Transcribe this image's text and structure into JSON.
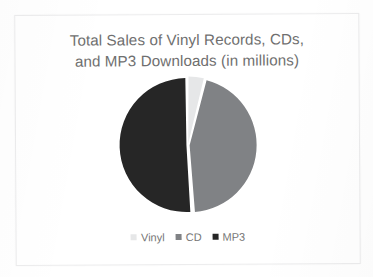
{
  "slide": {
    "title_line_1": "Total Sales of Vinyl Records, CDs,",
    "title_line_2": "and MP3 Downloads (in millions)"
  },
  "legend": {
    "entries": [
      {
        "label": "Vinyl",
        "color": "#E6E7E8",
        "marker": "square-marker-vinyl"
      },
      {
        "label": "CD",
        "color": "#808285",
        "marker": "square-marker-cd"
      },
      {
        "label": "MP3",
        "color": "#262626",
        "marker": "square-marker-mp3"
      }
    ]
  },
  "chart_data": {
    "type": "pie",
    "title": "Total Sales of Vinyl Records, CDs, and MP3 Downloads (in millions)",
    "xlabel": "",
    "ylabel": "",
    "categories": [
      "Vinyl",
      "CD",
      "MP3"
    ],
    "values": [
      4,
      45,
      51
    ],
    "units": "millions",
    "legend_position": "bottom",
    "grid": false,
    "data_labels": false,
    "start_angle_deg": 0,
    "direction": "clockwise",
    "slice_colors": [
      "#E6E7E8",
      "#808285",
      "#262626"
    ],
    "slice_gap_degrees": 1.2,
    "slices": [
      {
        "name": "Vinyl",
        "value": 4,
        "percent": 4,
        "color": "#E6E7E8",
        "start_deg": 0,
        "end_deg": 14.4
      },
      {
        "name": "CD",
        "value": 45,
        "percent": 45,
        "color": "#808285",
        "start_deg": 14.4,
        "end_deg": 176.4
      },
      {
        "name": "MP3",
        "value": 51,
        "percent": 51,
        "color": "#262626",
        "start_deg": 176.4,
        "end_deg": 360
      }
    ]
  },
  "geometry": {
    "center_x": 86,
    "center_y": 75,
    "radius": 67
  }
}
